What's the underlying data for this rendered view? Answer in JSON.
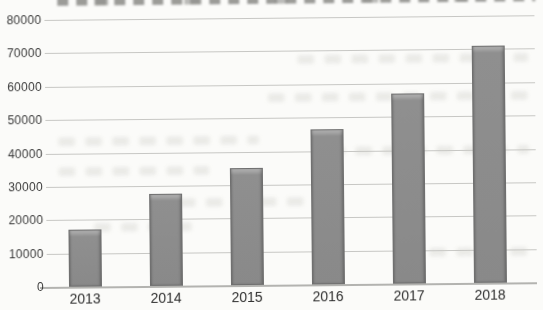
{
  "chart_data": {
    "type": "bar",
    "title": "",
    "xlabel": "",
    "ylabel": "",
    "categories": [
      "2013",
      "2014",
      "2015",
      "2016",
      "2017",
      "2018"
    ],
    "values": [
      17000,
      27500,
      35000,
      46500,
      57000,
      71000
    ],
    "ylim": [
      0,
      80000
    ],
    "ytick_step": 10000,
    "ytick_labels": [
      "0",
      "10000",
      "20000",
      "30000",
      "40000",
      "50000",
      "60000",
      "70000",
      "80000"
    ],
    "grid": true,
    "legend": false,
    "series_count": 1
  },
  "colors": {
    "bar_fill": "#8f8f8f",
    "bar_border": "#6f6f6f",
    "bar_highlight": "#b3b3b3",
    "gridline": "#c7c7c4",
    "axis_line": "#b3b3b0",
    "text": "#3a3a3a",
    "page_background": "#fbfbf9"
  }
}
